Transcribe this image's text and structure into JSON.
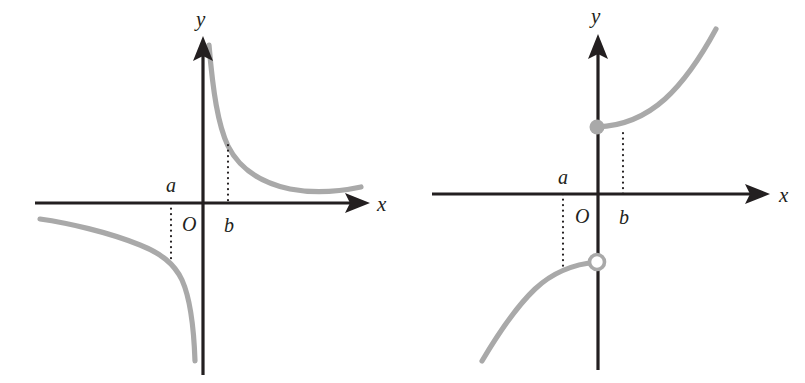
{
  "figure": {
    "background_color": "#ffffff",
    "curve_color": "#a9a9a9",
    "axis_color": "#231f20",
    "width": 805,
    "height": 383
  },
  "panels": [
    {
      "id": "left-panel",
      "name": "hyperbola-graph",
      "axes": {
        "x_label": "x",
        "y_label": "y",
        "origin_label": "O",
        "origin": {
          "x": 203,
          "y": 203
        },
        "x_axis": {
          "start_x": 35,
          "end_x": 352,
          "arrow_tip_x": 370,
          "y": 203
        },
        "y_axis": {
          "x": 203,
          "start_y": 375,
          "end_y": 56,
          "arrow_tip_y": 36
        }
      },
      "tick_labels": [
        {
          "text": "a",
          "x": 166,
          "y": 192,
          "name": "tick-label-a"
        },
        {
          "text": "b",
          "x": 224,
          "y": 232,
          "name": "tick-label-b"
        }
      ],
      "origin_label_pos": {
        "x": 182,
        "y": 231
      },
      "x_label_pos": {
        "x": 377,
        "y": 211
      },
      "y_label_pos": {
        "x": 196,
        "y": 26
      },
      "guides": [
        {
          "name": "guide-dotted-a",
          "x": 171,
          "y1": 203,
          "y2": 259
        },
        {
          "name": "guide-dotted-b",
          "x": 228,
          "y1": 145,
          "y2": 203
        }
      ],
      "points": [],
      "curves": [
        {
          "name": "branch-quadrant-one",
          "path": "M 209 45 C 213 92, 218 125, 228 146 C 240 170, 262 183, 290 189 C 316 194, 342 191, 361 187"
        },
        {
          "name": "branch-quadrant-three",
          "path": "M 40 219 C 68 223, 108 232, 140 245 C 160 253, 174 263, 182 280 C 191 300, 194 332, 195 361"
        }
      ]
    },
    {
      "id": "right-panel",
      "name": "jump-discontinuity-graph",
      "axes": {
        "x_label": "x",
        "y_label": "y",
        "origin_label": "O",
        "origin": {
          "x": 598,
          "y": 194
        },
        "x_axis": {
          "start_x": 432,
          "end_x": 752,
          "arrow_tip_x": 770,
          "y": 194
        },
        "y_axis": {
          "x": 598,
          "start_y": 370,
          "end_y": 54,
          "arrow_tip_y": 34
        }
      },
      "tick_labels": [
        {
          "text": "a",
          "x": 558,
          "y": 184,
          "name": "tick-label-a"
        },
        {
          "text": "b",
          "x": 619,
          "y": 224,
          "name": "tick-label-b"
        }
      ],
      "origin_label_pos": {
        "x": 575,
        "y": 223
      },
      "x_label_pos": {
        "x": 779,
        "y": 202
      },
      "y_label_pos": {
        "x": 591,
        "y": 23
      },
      "guides": [
        {
          "name": "guide-dotted-a",
          "x": 563,
          "y1": 194,
          "y2": 268
        },
        {
          "name": "guide-dotted-b",
          "x": 623,
          "y1": 133,
          "y2": 194
        }
      ],
      "points": [
        {
          "name": "filled-endpoint",
          "type": "filled",
          "x": 597,
          "y": 127,
          "r": 7.5
        },
        {
          "name": "open-endpoint",
          "type": "open",
          "x": 597,
          "y": 262,
          "r": 7.5
        }
      ],
      "curves": [
        {
          "name": "upper-branch",
          "path": "M 597 127 C 622 126, 645 117, 665 99 C 687 79, 703 53, 716 29"
        },
        {
          "name": "lower-branch",
          "path": "M 482 361 C 498 334, 515 308, 535 289 C 553 272, 575 264, 597 262"
        }
      ]
    }
  ]
}
